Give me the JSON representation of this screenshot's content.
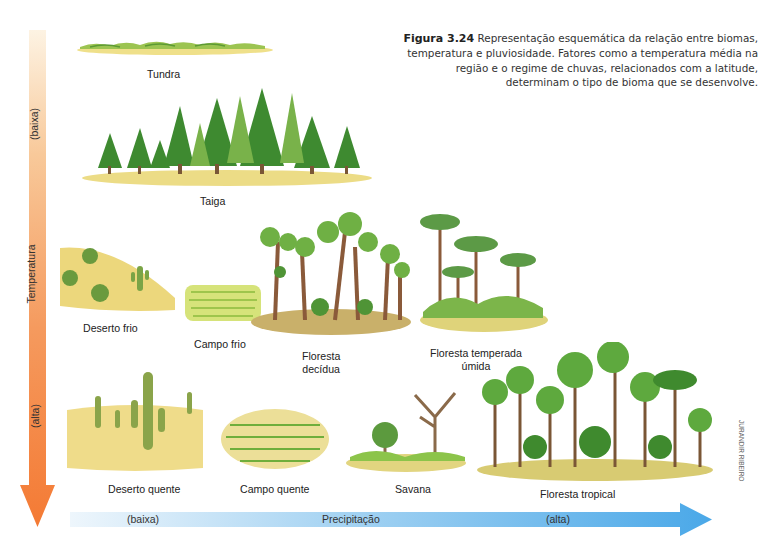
{
  "caption": {
    "figure_label": "Figura 3.24",
    "text": "Representação esquemática da relação entre biomas, temperatura e pluviosidade. Fatores como a temperatura média na região e o regime de chuvas, relacionados com a latitude, determinam o tipo de bioma que se desenvolve."
  },
  "axes": {
    "temperature": {
      "title": "Temperatura",
      "low_label": "(baixa)",
      "high_label": "(alta)",
      "direction": "top-to-bottom",
      "color_start": "#fbe9cf",
      "color_end": "#f47f3c"
    },
    "precipitation": {
      "title": "Precipitação",
      "low_label": "(baixa)",
      "high_label": "(alta)",
      "direction": "left-to-right",
      "color_start": "#e3f1fb",
      "color_end": "#4aa8e8"
    }
  },
  "biomes": [
    {
      "id": "tundra",
      "label": "Tundra",
      "row": "cold"
    },
    {
      "id": "taiga",
      "label": "Taiga",
      "row": "cold"
    },
    {
      "id": "deserto-frio",
      "label": "Deserto frio",
      "row": "temperate"
    },
    {
      "id": "campo-frio",
      "label": "Campo frio",
      "row": "temperate"
    },
    {
      "id": "floresta-decidua",
      "label_line1": "Floresta",
      "label_line2": "decídua",
      "row": "temperate"
    },
    {
      "id": "floresta-temperada-umida",
      "label_line1": "Floresta temperada",
      "label_line2": "úmida",
      "row": "temperate"
    },
    {
      "id": "deserto-quente",
      "label": "Deserto quente",
      "row": "hot"
    },
    {
      "id": "campo-quente",
      "label": "Campo quente",
      "row": "hot"
    },
    {
      "id": "savana",
      "label": "Savana",
      "row": "hot"
    },
    {
      "id": "floresta-tropical",
      "label": "Floresta tropical",
      "row": "hot"
    }
  ],
  "credit": "JURANDIR RIBEIRO",
  "colors": {
    "ground": "#ecd97a",
    "foliage_dark": "#3f8a2e",
    "foliage_light": "#8cc44a",
    "trunk": "#8a5a3a"
  }
}
